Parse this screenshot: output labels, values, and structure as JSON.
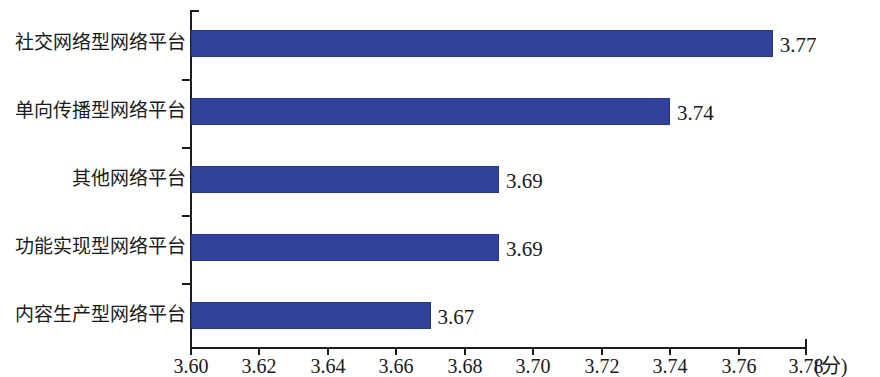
{
  "chart_data": {
    "type": "bar",
    "orientation": "horizontal",
    "title": "",
    "subtitle": "",
    "xlabel": "(分)",
    "ylabel": "",
    "categories": [
      "社交网络型网络平台",
      "单向传播型网络平台",
      "其他网络平台",
      "功能实现型网络平台",
      "内容生产型网络平台"
    ],
    "values": [
      3.77,
      3.74,
      3.69,
      3.69,
      3.67
    ],
    "data_labels": [
      "3.77",
      "3.74",
      "3.69",
      "3.69",
      "3.67"
    ],
    "xlim": [
      3.6,
      3.78
    ],
    "xticks": [
      3.6,
      3.62,
      3.64,
      3.66,
      3.68,
      3.7,
      3.72,
      3.74,
      3.76,
      3.78
    ],
    "xtick_labels": [
      "3.60",
      "3.62",
      "3.64",
      "3.66",
      "3.68",
      "3.70",
      "3.72",
      "3.74",
      "3.76",
      "3.78"
    ],
    "grid": false,
    "legend": null,
    "legend_position": "none",
    "bar_color": "#31409b",
    "axis_color": "#1c1c1c",
    "background_color": "#ffffff"
  }
}
